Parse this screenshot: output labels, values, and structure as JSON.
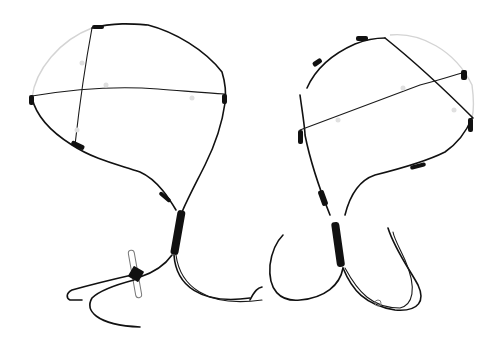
{
  "image": {
    "description": "Product photo of two black wire harness loops with cross wires on a white background",
    "background_color": "#ffffff",
    "wire_color": "#111111",
    "objects": [
      {
        "name": "left-wire-harness",
        "features": [
          "round loop",
          "horizontal cross wire",
          "vertical cross wire",
          "twisted stem",
          "paperclip connector",
          "trailing leads"
        ]
      },
      {
        "name": "right-wire-harness",
        "features": [
          "round loop",
          "two diagonal cross wires",
          "twisted stem",
          "small connector",
          "trailing leads"
        ]
      }
    ]
  }
}
